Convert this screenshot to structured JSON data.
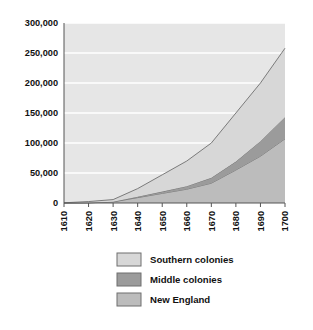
{
  "chart_data": {
    "type": "area",
    "title": "",
    "subtitle": "",
    "xlabel": "",
    "ylabel": "",
    "stacked": true,
    "grid": true,
    "grid_orientation": "horizontal",
    "legend_position": "bottom",
    "x": [
      1610,
      1620,
      1630,
      1640,
      1650,
      1660,
      1670,
      1680,
      1690,
      1700
    ],
    "xlim": [
      1610,
      1700
    ],
    "ylim": [
      0,
      300000
    ],
    "xticks": [
      "1610",
      "1620",
      "1630",
      "1640",
      "1650",
      "1660",
      "1670",
      "1680",
      "1690",
      "1700"
    ],
    "yticks": [
      "0",
      "50,000",
      "100,000",
      "150,000",
      "200,000",
      "250,000",
      "300,000"
    ],
    "ytick_values": [
      0,
      50000,
      100000,
      150000,
      200000,
      250000,
      300000
    ],
    "series": [
      {
        "name": "New England",
        "color": "#bcbcbc",
        "values": [
          0,
          200,
          1800,
          9000,
          16000,
          23000,
          33000,
          55000,
          78000,
          107000
        ]
      },
      {
        "name": "Middle colonies",
        "color": "#9b9b9b",
        "values": [
          0,
          100,
          400,
          1500,
          3000,
          5000,
          9000,
          14000,
          25000,
          36000
        ]
      },
      {
        "name": "Southern colonies",
        "color": "#d7d7d7",
        "values": [
          350,
          2100,
          3500,
          13500,
          28000,
          42000,
          58000,
          81000,
          97000,
          115000
        ]
      }
    ],
    "stack_order": [
      "New England",
      "Middle colonies",
      "Southern colonies"
    ],
    "totals": [
      350,
      2400,
      5700,
      24000,
      47000,
      70000,
      100000,
      150000,
      200000,
      258000
    ]
  },
  "legend": {
    "items": [
      {
        "label": "Southern colonies",
        "color": "#d7d7d7"
      },
      {
        "label": "Middle colonies",
        "color": "#9b9b9b"
      },
      {
        "label": "New England",
        "color": "#bcbcbc"
      }
    ]
  },
  "style": {
    "plot_background": "#e6e6e6",
    "gridline_color": "#ffffff",
    "axis_color": "#555555",
    "band_edge_color": "#6f6f6f",
    "text_color": "#111111",
    "page_background": "#ffffff",
    "legend_swatch_border": "#6f6f6f"
  }
}
